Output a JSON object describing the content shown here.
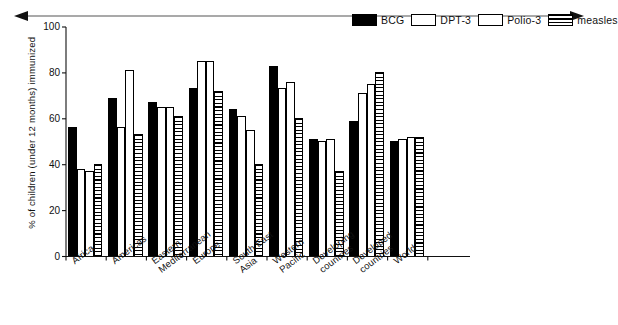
{
  "chart_data": {
    "type": "bar",
    "title": "",
    "xlabel": "",
    "ylabel": "% of children (under 12 months) immunized",
    "ylim": [
      0,
      100
    ],
    "yticks": [
      0,
      20,
      40,
      60,
      80,
      100
    ],
    "grid": false,
    "legend_position": "top-right",
    "categories": [
      "Africa",
      "Americas",
      "Eastern\nMediterranean",
      "Europe",
      "South East\nAsia",
      "Western\nPacific",
      "Developing\ncountries",
      "Developed\ncountries",
      "World"
    ],
    "series": [
      {
        "name": "BCG",
        "fill": "solid-black",
        "values": [
          56,
          69,
          67,
          73,
          64,
          83,
          51,
          59,
          50
        ]
      },
      {
        "name": "DPT-3",
        "fill": "white-outline",
        "values": [
          38,
          56,
          65,
          85,
          61,
          73,
          50,
          71,
          51
        ]
      },
      {
        "name": "Polio-3",
        "fill": "white-outline",
        "values": [
          37,
          81,
          65,
          85,
          55,
          76,
          51,
          75,
          52
        ]
      },
      {
        "name": "measles",
        "fill": "horizontal-stripes",
        "values": [
          40,
          53,
          61,
          72,
          40,
          60,
          37,
          80,
          52
        ]
      }
    ]
  },
  "legend": {
    "items": [
      {
        "label": "BCG",
        "swatch": "solid-black-swatch"
      },
      {
        "label": "DPT-3",
        "swatch": "white-outline-swatch"
      },
      {
        "label": "Polio-3",
        "swatch": "white-outline-swatch"
      },
      {
        "label": "measles",
        "swatch": "striped-swatch"
      }
    ]
  },
  "decorations": {
    "top_arrow": "double-headed-horizontal-arrow"
  },
  "colors": {
    "ink": "#000000",
    "background": "#ffffff",
    "series_bcg": "#000000",
    "series_dpt3": "#ffffff",
    "series_polio3": "#ffffff",
    "series_measles": "#ffffff"
  }
}
